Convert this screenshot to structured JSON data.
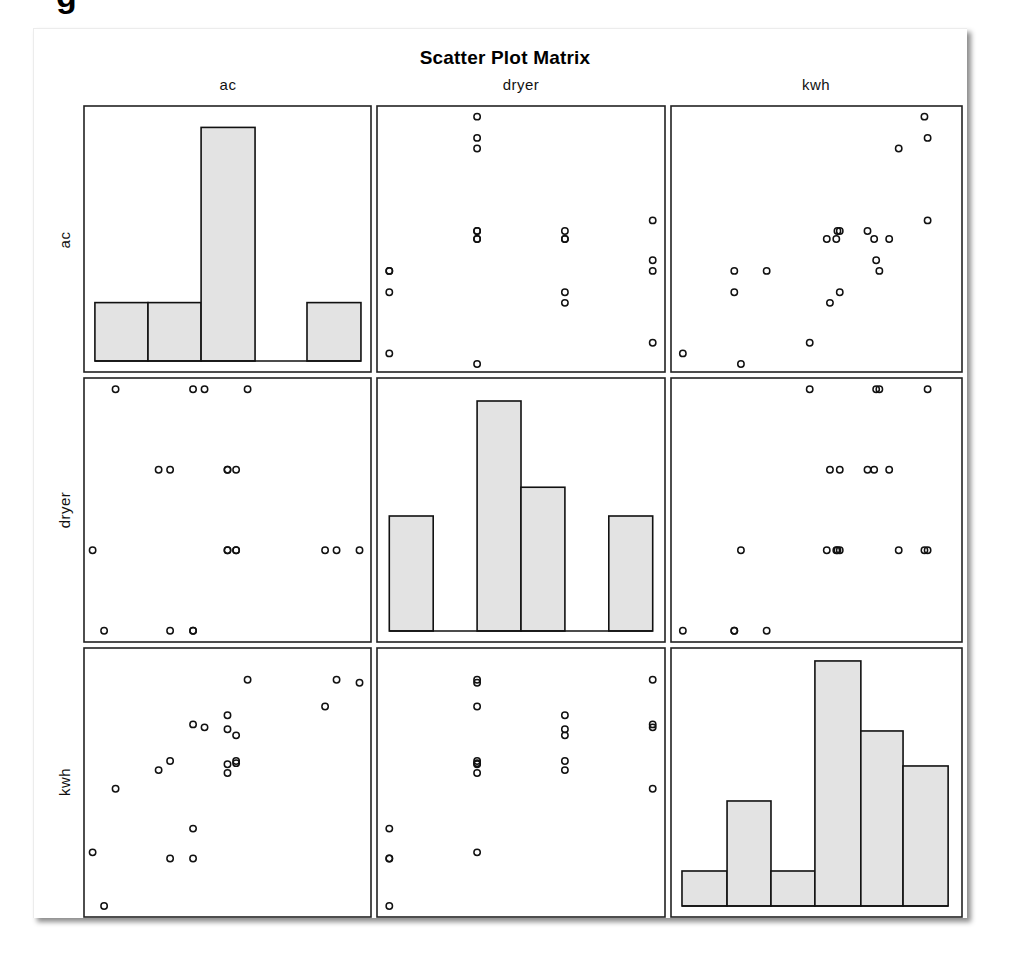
{
  "page": {
    "cropped_heading_fragment": "g"
  },
  "chart_data": {
    "type": "scatter",
    "subtype": "scatter_matrix",
    "title": "Scatter Plot Matrix",
    "variables": [
      "ac",
      "dryer",
      "kwh"
    ],
    "diagonal": "histogram",
    "grid": false,
    "legend": null,
    "marker": "open-circle",
    "axis_ranges": {
      "ac": [
        0,
        10
      ],
      "dryer": [
        -0.14,
        3.14
      ],
      "kwh": [
        0,
        100.7
      ]
    },
    "observations": [
      {
        "ac": 5.7,
        "dryer": 3,
        "kwh": 88.8
      },
      {
        "ac": 8.8,
        "dryer": 1,
        "kwh": 88.8
      },
      {
        "ac": 9.6,
        "dryer": 1,
        "kwh": 87.7
      },
      {
        "ac": 8.4,
        "dryer": 1,
        "kwh": 78.8
      },
      {
        "ac": 5.0,
        "dryer": 2,
        "kwh": 75.5
      },
      {
        "ac": 3.8,
        "dryer": 3,
        "kwh": 72.1
      },
      {
        "ac": 4.2,
        "dryer": 3,
        "kwh": 71.0
      },
      {
        "ac": 5.0,
        "dryer": 2,
        "kwh": 70.3
      },
      {
        "ac": 5.3,
        "dryer": 2,
        "kwh": 68.0
      },
      {
        "ac": 3.0,
        "dryer": 2,
        "kwh": 58.4
      },
      {
        "ac": 2.6,
        "dryer": 2,
        "kwh": 55.0
      },
      {
        "ac": 5.0,
        "dryer": 1,
        "kwh": 57.2
      },
      {
        "ac": 5.3,
        "dryer": 1,
        "kwh": 58.4
      },
      {
        "ac": 5.3,
        "dryer": 1,
        "kwh": 57.6
      },
      {
        "ac": 5.0,
        "dryer": 1,
        "kwh": 53.9
      },
      {
        "ac": 1.1,
        "dryer": 3,
        "kwh": 48.0
      },
      {
        "ac": 3.8,
        "dryer": 0,
        "kwh": 33.1
      },
      {
        "ac": 0.3,
        "dryer": 1,
        "kwh": 24.2
      },
      {
        "ac": 3.0,
        "dryer": 0,
        "kwh": 21.9
      },
      {
        "ac": 3.8,
        "dryer": 0,
        "kwh": 21.9
      },
      {
        "ac": 0.7,
        "dryer": 0,
        "kwh": 4.1
      }
    ],
    "histograms": {
      "ac": {
        "bin_edges": [
          0.38,
          2.23,
          4.08,
          5.96,
          7.77,
          9.65
        ],
        "counts": [
          3,
          3,
          12,
          0,
          3
        ],
        "ylim": [
          0,
          13.1
        ]
      },
      "dryer": {
        "bin_edges": [
          0.0,
          0.5,
          1.0,
          1.5,
          2.0,
          2.5,
          3.0
        ],
        "counts": [
          4,
          0,
          8,
          5,
          0,
          4
        ],
        "ylim": [
          0,
          8.8
        ]
      },
      "kwh": {
        "bin_edges": [
          3.8,
          19.4,
          34.6,
          49.8,
          65.7,
          80.3,
          95.9
        ],
        "counts": [
          1,
          3,
          1,
          7,
          5,
          4
        ],
        "ylim": [
          0,
          7.37
        ]
      }
    },
    "colors": {
      "bar_fill": "#e3e3e3",
      "bar_stroke": "#111111",
      "panel_stroke": "#222222",
      "marker_stroke": "#111111"
    },
    "xlabel": "",
    "ylabel": ""
  }
}
